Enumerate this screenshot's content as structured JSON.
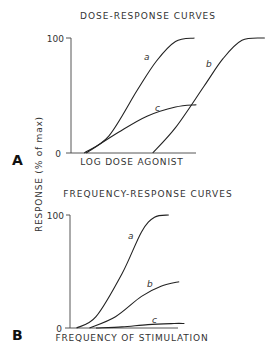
{
  "shared": {
    "ylabel": "RESPONSE (% of max)"
  },
  "chart_data": [
    {
      "panel": "A",
      "type": "line",
      "title": "DOSE-RESPONSE CURVES",
      "xlabel": "LOG DOSE AGONIST",
      "ylabel": "RESPONSE (% of max)",
      "ytick_labels": [
        "0",
        "100"
      ],
      "ylim": [
        0,
        100
      ],
      "xlim": [
        0,
        10
      ],
      "grid": false,
      "legend": "none (curves labeled inline)",
      "series": [
        {
          "name": "a",
          "x": [
            0.7,
            2.0,
            3.5,
            4.5,
            5.5,
            6.5
          ],
          "y": [
            0,
            15,
            55,
            80,
            97,
            100
          ]
        },
        {
          "name": "c",
          "x": [
            0.8,
            2.5,
            4.0,
            5.5,
            6.6
          ],
          "y": [
            0,
            18,
            32,
            40,
            42
          ]
        },
        {
          "name": "b",
          "x": [
            4.3,
            5.5,
            7.0,
            8.0,
            9.0,
            10.2
          ],
          "y": [
            0,
            22,
            58,
            82,
            98,
            100
          ]
        }
      ]
    },
    {
      "panel": "B",
      "type": "line",
      "title": "FREQUENCY-RESPONSE CURVES",
      "xlabel": "FREQUENCY OF STIMULATION",
      "ylabel": "RESPONSE (% of max)",
      "ytick_labels": [
        "0",
        "100"
      ],
      "ylim": [
        0,
        100
      ],
      "xlim": [
        0,
        10
      ],
      "grid": false,
      "legend": "none (curves labeled inline)",
      "series": [
        {
          "name": "a",
          "x": [
            0.5,
            2.0,
            4.0,
            5.5,
            6.5,
            7.6
          ],
          "y": [
            0,
            10,
            48,
            85,
            98,
            100
          ]
        },
        {
          "name": "b",
          "x": [
            1.5,
            3.5,
            5.5,
            7.0,
            8.4
          ],
          "y": [
            0,
            10,
            28,
            37,
            41
          ]
        },
        {
          "name": "c",
          "x": [
            2.0,
            4.0,
            6.0,
            8.0,
            8.8
          ],
          "y": [
            0,
            1,
            3,
            4,
            4
          ]
        }
      ]
    }
  ]
}
